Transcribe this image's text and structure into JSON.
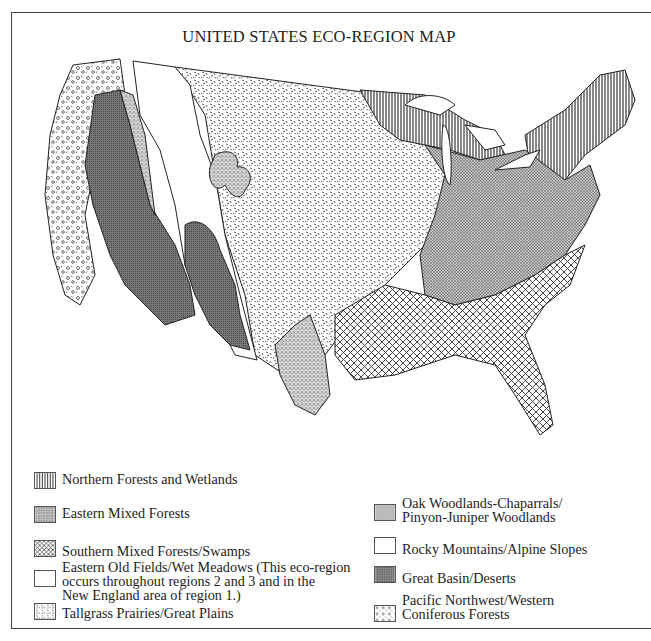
{
  "title": "UNITED STATES ECO-REGION MAP",
  "colors": {
    "ink": "#1d1d1d",
    "great_basin_fill": "#6e6e6e",
    "eastern_mixed_fill": "#9a9a9a",
    "oak_woodlands_fill": "#b5b5b5",
    "background": "#ffffff"
  },
  "legend": {
    "left": [
      {
        "id": "northern-forests",
        "pattern": "vertical-lines",
        "label": "Northern Forests and Wetlands"
      },
      {
        "id": "eastern-mixed",
        "pattern": "fine-stipple",
        "label": "Eastern Mixed Forests"
      },
      {
        "id": "southern-mixed",
        "pattern": "crosshatch",
        "label": "Southern Mixed Forests/Swamps"
      },
      {
        "id": "eastern-old-fields",
        "pattern": "blank",
        "label": "Eastern Old Fields/Wet Meadows (This eco-region\noccurs throughout regions 2 and 3 and in the\nNew England area of region 1.)"
      },
      {
        "id": "tallgrass",
        "pattern": "dashes",
        "label": "Tallgrass Prairies/Great Plains"
      }
    ],
    "right": [
      {
        "id": "oak-woodlands",
        "pattern": "coarse-stipple",
        "label": "Oak Woodlands-Chaparrals/\nPinyon-Juniper Woodlands"
      },
      {
        "id": "rocky-mountains",
        "pattern": "blank",
        "label": "Rocky Mountains/Alpine Slopes"
      },
      {
        "id": "great-basin",
        "pattern": "dense-dark",
        "label": "Great Basin/Deserts"
      },
      {
        "id": "pacific-northwest",
        "pattern": "circles",
        "label": "Pacific Northwest/Western\nConiferous Forests"
      }
    ]
  },
  "map": {
    "regions": [
      "Pacific Northwest/Western Coniferous Forests (west coast)",
      "Great Basin/Deserts (NV, UT, AZ, eastern OR/WA, NM)",
      "Oak Woodlands-Chaparrals/Pinyon-Juniper Woodlands (bands around basins, TX)",
      "Rocky Mountains/Alpine Slopes (ID, MT, WY, CO)",
      "Tallgrass Prairies/Great Plains (central states)",
      "Northern Forests and Wetlands (MN, WI, MI, NY, New England)",
      "Eastern Mixed Forests (Ohio valley, mid-Atlantic)",
      "Southern Mixed Forests/Swamps (Southeast, Gulf coast, FL)"
    ]
  }
}
